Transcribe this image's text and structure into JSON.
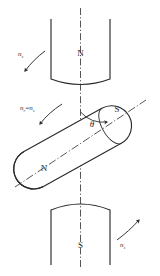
{
  "figure": {
    "stroke_color": "#2b2b2b",
    "background_color": "#ffffff"
  },
  "stator": {
    "top_pole": {
      "label": "N",
      "name": "top-pole-piece"
    },
    "bottom_pole": {
      "label": "S",
      "name": "bottom-pole-piece"
    }
  },
  "rotor": {
    "north_label": "N",
    "south_label": "S",
    "tilt_degrees": 29
  },
  "angle": {
    "symbol": "θ"
  },
  "speeds": [
    {
      "id": "stator-speed-top-left",
      "symbol": "n",
      "subscript": "s",
      "direction": "down-left"
    },
    {
      "id": "rotor-speed-middle-left",
      "symbol_left": "n",
      "subscript_left": "r",
      "equals": "=",
      "symbol_right": "n",
      "subscript_right": "s",
      "direction": "down-left"
    },
    {
      "id": "stator-speed-bottom-right",
      "symbol": "n",
      "subscript": "s",
      "direction": "up-right"
    }
  ],
  "axes": {
    "vertical_axis_style": "dash-dot",
    "rotor_axis_style": "dash-dot",
    "tangent_line_style": "dashed"
  }
}
